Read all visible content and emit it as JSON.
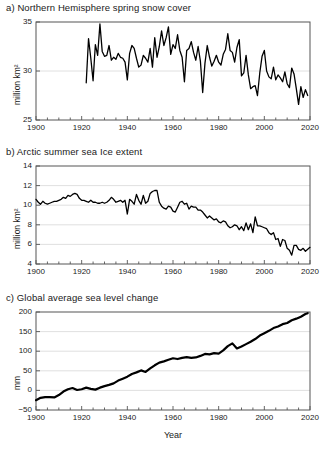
{
  "figure": {
    "xlabel": "Year",
    "panels": [
      "a) Northern Hemisphere spring snow cover",
      "b) Arctic summer sea Ice extent",
      "c) Global average sea level change"
    ]
  },
  "chart_data": [
    {
      "type": "line",
      "title": "a) Northern Hemisphere spring snow cover",
      "panel_label": "a)",
      "xlabel": "",
      "ylabel": "million km²",
      "xlim": [
        1900,
        2020
      ],
      "ylim": [
        25,
        35
      ],
      "xticks": [
        1900,
        1920,
        1940,
        1960,
        1980,
        2000,
        2020
      ],
      "yticks": [
        25,
        30,
        35
      ],
      "grid": true,
      "x": [
        1922,
        1923,
        1924,
        1925,
        1926,
        1927,
        1928,
        1929,
        1930,
        1931,
        1932,
        1933,
        1934,
        1935,
        1936,
        1937,
        1938,
        1939,
        1940,
        1941,
        1942,
        1943,
        1944,
        1945,
        1946,
        1947,
        1948,
        1949,
        1950,
        1951,
        1952,
        1953,
        1954,
        1955,
        1956,
        1957,
        1958,
        1959,
        1960,
        1961,
        1962,
        1963,
        1964,
        1965,
        1966,
        1967,
        1968,
        1969,
        1970,
        1971,
        1972,
        1973,
        1974,
        1975,
        1976,
        1977,
        1978,
        1979,
        1980,
        1981,
        1982,
        1983,
        1984,
        1985,
        1986,
        1987,
        1988,
        1989,
        1990,
        1991,
        1992,
        1993,
        1994,
        1995,
        1996,
        1997,
        1998,
        1999,
        2000,
        2001,
        2002,
        2003,
        2004,
        2005,
        2006,
        2007,
        2008,
        2009,
        2010,
        2011,
        2012,
        2013,
        2014,
        2015,
        2016,
        2017,
        2018,
        2019
      ],
      "values": [
        28.8,
        33.3,
        31.3,
        29.0,
        32.7,
        31.6,
        34.8,
        32.0,
        31.5,
        31.6,
        32.6,
        31.1,
        31.4,
        31.2,
        31.8,
        31.4,
        31.3,
        30.9,
        29.1,
        31.8,
        32.6,
        32.3,
        31.3,
        30.4,
        30.6,
        31.6,
        31.3,
        30.9,
        32.3,
        30.4,
        33.4,
        31.4,
        32.5,
        34.1,
        32.6,
        33.4,
        34.5,
        31.7,
        32.7,
        32.3,
        33.7,
        32.1,
        31.4,
        28.9,
        32.1,
        32.3,
        33.0,
        31.9,
        31.1,
        32.5,
        31.0,
        27.8,
        30.8,
        32.6,
        31.4,
        30.5,
        31.0,
        31.6,
        30.9,
        30.6,
        31.7,
        32.2,
        33.8,
        32.1,
        31.9,
        30.9,
        32.4,
        33.2,
        29.5,
        29.8,
        31.6,
        29.6,
        28.2,
        28.4,
        28.5,
        27.5,
        29.8,
        31.5,
        32.1,
        30.0,
        29.4,
        29.2,
        30.4,
        29.1,
        29.6,
        29.3,
        28.9,
        29.9,
        28.7,
        28.3,
        30.3,
        29.7,
        28.2,
        26.6,
        28.4,
        27.3,
        28.1,
        27.5
      ]
    },
    {
      "type": "line",
      "title": "b) Arctic summer sea Ice extent",
      "panel_label": "b)",
      "xlabel": "",
      "ylabel": "million km²",
      "xlim": [
        1900,
        2020
      ],
      "ylim": [
        4,
        14
      ],
      "xticks": [
        1900,
        1920,
        1940,
        1960,
        1980,
        2000,
        2020
      ],
      "yticks": [
        4,
        6,
        8,
        10,
        12,
        14
      ],
      "grid": true,
      "x": [
        1900,
        1901,
        1902,
        1903,
        1904,
        1905,
        1906,
        1907,
        1908,
        1909,
        1910,
        1911,
        1912,
        1913,
        1914,
        1915,
        1916,
        1917,
        1918,
        1919,
        1920,
        1921,
        1922,
        1923,
        1924,
        1925,
        1926,
        1927,
        1928,
        1929,
        1930,
        1931,
        1932,
        1933,
        1934,
        1935,
        1936,
        1937,
        1938,
        1939,
        1940,
        1941,
        1942,
        1943,
        1944,
        1945,
        1946,
        1947,
        1948,
        1949,
        1950,
        1951,
        1952,
        1953,
        1954,
        1955,
        1956,
        1957,
        1958,
        1959,
        1960,
        1961,
        1962,
        1963,
        1964,
        1965,
        1966,
        1967,
        1968,
        1969,
        1970,
        1971,
        1972,
        1973,
        1974,
        1975,
        1976,
        1977,
        1978,
        1979,
        1980,
        1981,
        1982,
        1983,
        1984,
        1985,
        1986,
        1987,
        1988,
        1989,
        1990,
        1991,
        1992,
        1993,
        1994,
        1995,
        1996,
        1997,
        1998,
        1999,
        2000,
        2001,
        2002,
        2003,
        2004,
        2005,
        2006,
        2007,
        2008,
        2009,
        2010,
        2011,
        2012,
        2013,
        2014,
        2015,
        2016,
        2017,
        2018,
        2019,
        2020
      ],
      "values": [
        10.6,
        10.3,
        10.1,
        10.4,
        10.2,
        10.1,
        10.2,
        10.3,
        10.4,
        10.4,
        10.5,
        10.6,
        10.8,
        10.7,
        11.0,
        10.9,
        11.1,
        11.2,
        11.1,
        10.7,
        10.5,
        10.5,
        10.4,
        10.3,
        10.5,
        10.3,
        10.3,
        10.2,
        10.2,
        10.3,
        10.2,
        10.3,
        10.5,
        10.8,
        10.6,
        10.3,
        10.4,
        10.5,
        10.3,
        10.5,
        9.1,
        10.6,
        10.4,
        10.1,
        11.1,
        10.5,
        10.1,
        11.0,
        10.2,
        10.4,
        11.2,
        11.4,
        11.5,
        11.5,
        10.3,
        9.9,
        9.7,
        9.6,
        9.9,
        9.8,
        9.4,
        9.3,
        9.8,
        10.3,
        10.4,
        10.1,
        10.2,
        9.6,
        9.9,
        9.8,
        9.8,
        9.5,
        9.5,
        9.3,
        9.0,
        8.7,
        8.9,
        8.7,
        8.5,
        8.6,
        8.3,
        8.2,
        8.4,
        8.3,
        7.9,
        7.7,
        7.8,
        8.0,
        7.9,
        7.5,
        7.8,
        7.4,
        8.2,
        7.5,
        8.1,
        7.2,
        8.8,
        7.9,
        7.9,
        7.8,
        7.7,
        7.6,
        7.2,
        7.0,
        7.2,
        6.5,
        6.6,
        5.8,
        6.5,
        6.4,
        5.6,
        5.4,
        4.9,
        5.9,
        5.9,
        5.5,
        5.4,
        5.6,
        5.3,
        5.5,
        5.7
      ]
    },
    {
      "type": "line",
      "title": "c) Global average sea level change",
      "panel_label": "c)",
      "xlabel": "Year",
      "ylabel": "mm",
      "xlim": [
        1900,
        2020
      ],
      "ylim": [
        -50,
        200
      ],
      "xticks": [
        1900,
        1920,
        1940,
        1960,
        1980,
        2000,
        2020
      ],
      "yticks": [
        -50,
        0,
        50,
        100,
        150,
        200
      ],
      "grid": true,
      "x": [
        1900,
        1902,
        1904,
        1906,
        1908,
        1910,
        1912,
        1914,
        1916,
        1918,
        1920,
        1922,
        1924,
        1926,
        1928,
        1930,
        1932,
        1934,
        1936,
        1938,
        1940,
        1942,
        1944,
        1946,
        1948,
        1950,
        1952,
        1954,
        1956,
        1958,
        1960,
        1962,
        1964,
        1966,
        1968,
        1970,
        1972,
        1974,
        1976,
        1978,
        1980,
        1982,
        1984,
        1986,
        1988,
        1990,
        1992,
        1994,
        1996,
        1998,
        2000,
        2002,
        2004,
        2006,
        2008,
        2010,
        2012,
        2014,
        2016,
        2018,
        2019
      ],
      "values": [
        -25,
        -19,
        -17,
        -17,
        -18,
        -12,
        -3,
        3,
        6,
        1,
        3,
        7,
        4,
        2,
        7,
        11,
        14,
        18,
        25,
        30,
        35,
        42,
        46,
        51,
        47,
        56,
        64,
        71,
        74,
        78,
        82,
        80,
        83,
        85,
        83,
        84,
        88,
        93,
        92,
        95,
        94,
        102,
        113,
        120,
        107,
        112,
        118,
        124,
        131,
        140,
        146,
        152,
        159,
        163,
        169,
        172,
        179,
        183,
        188,
        195,
        197
      ]
    }
  ]
}
